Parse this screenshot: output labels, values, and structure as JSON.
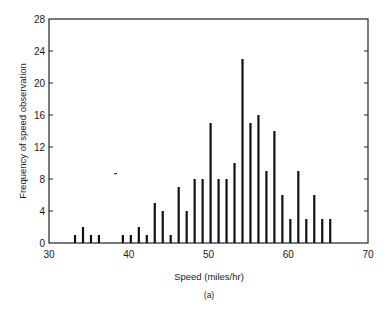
{
  "chart_data": {
    "type": "bar",
    "title": "",
    "xlabel": "Speed (miles/hr)",
    "ylabel": "Frequency of speed observation",
    "caption": "(a)",
    "xlim": [
      30,
      70
    ],
    "ylim": [
      0,
      28
    ],
    "x_ticks": [
      30,
      40,
      50,
      60,
      70
    ],
    "y_ticks": [
      0,
      4,
      8,
      12,
      16,
      20,
      24,
      28
    ],
    "grid": false,
    "legend": null,
    "bar_style": "thin vertical lines",
    "x": [
      33,
      34,
      35,
      36,
      39,
      40,
      41,
      42,
      43,
      44,
      45,
      46,
      47,
      48,
      49,
      50,
      51,
      52,
      53,
      54,
      55,
      56,
      57,
      58,
      59,
      60,
      61,
      62,
      63,
      64,
      65
    ],
    "values": [
      1,
      2,
      1,
      1,
      1,
      1,
      2,
      1,
      5,
      4,
      1,
      7,
      4,
      8,
      8,
      15,
      8,
      8,
      10,
      23,
      15,
      16,
      9,
      14,
      6,
      3,
      9,
      3,
      6,
      3,
      3
    ]
  },
  "colors": {
    "bars": "#111111",
    "axes": "#222222",
    "background": "#ffffff"
  }
}
